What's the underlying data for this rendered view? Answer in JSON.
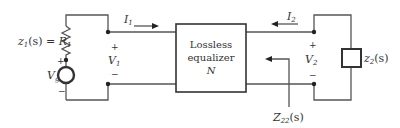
{
  "diagram": {
    "type": "two-port circuit",
    "source": {
      "impedance_label": "z1(s) = R1",
      "impedance_lhs": "z",
      "impedance_lhs_sub": "1",
      "impedance_arg": "(s) = ",
      "impedance_rhs": "R",
      "impedance_rhs_sub": "1",
      "voltage_label": "V",
      "voltage_sub": "g",
      "plus": "+",
      "minus": "−"
    },
    "port1": {
      "current": "I",
      "current_sub": "1",
      "voltage": "V",
      "voltage_sub": "1",
      "plus": "+",
      "minus": "−"
    },
    "network": {
      "line1": "Lossless",
      "line2": "equalizer",
      "line3": "N"
    },
    "port2": {
      "current": "I",
      "current_sub": "2",
      "voltage": "V",
      "voltage_sub": "2",
      "plus": "+",
      "minus": "−"
    },
    "load": {
      "label": "z",
      "label_sub": "2",
      "label_arg": "(s)"
    },
    "impedance_probe": {
      "label": "Z",
      "label_sub": "22",
      "label_arg": "(s)"
    },
    "colors": {
      "line": "#555555",
      "text": "#333333"
    }
  }
}
